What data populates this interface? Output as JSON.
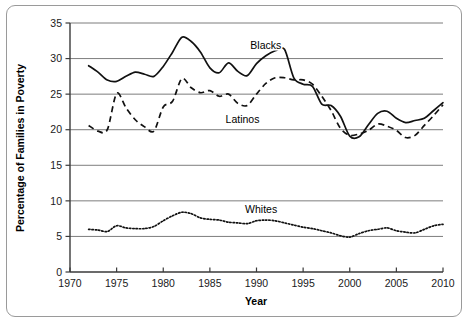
{
  "chart_data": {
    "type": "line",
    "title": "",
    "xlabel": "Year",
    "ylabel": "Percentage of Families in Poverty",
    "xlim": [
      1970,
      2010
    ],
    "ylim": [
      0,
      35
    ],
    "xticks": [
      "1970",
      "1975",
      "1980",
      "1985",
      "1990",
      "1995",
      "2000",
      "2005",
      "2010"
    ],
    "yticks": [
      "0",
      "5",
      "10",
      "15",
      "20",
      "25",
      "30",
      "35"
    ],
    "grid": "horizontal",
    "legend_position": "inline-labels",
    "series": [
      {
        "name": "Blacks",
        "style": "solid",
        "label_x": 1991.0,
        "label_y": 31.4,
        "x": [
          1972,
          1973,
          1974,
          1975,
          1976,
          1977,
          1978,
          1979,
          1980,
          1981,
          1982,
          1983,
          1984,
          1985,
          1986,
          1987,
          1988,
          1989,
          1990,
          1991,
          1992,
          1993,
          1994,
          1995,
          1996,
          1997,
          1998,
          1999,
          2000,
          2001,
          2002,
          2003,
          2004,
          2005,
          2006,
          2007,
          2008,
          2009,
          2010
        ],
        "values": [
          29.0,
          28.1,
          27.0,
          26.8,
          27.5,
          28.1,
          27.8,
          27.5,
          28.9,
          30.9,
          33.0,
          32.4,
          30.9,
          28.7,
          28.0,
          29.4,
          28.2,
          27.6,
          29.3,
          30.4,
          31.1,
          31.3,
          27.3,
          26.4,
          26.1,
          23.6,
          23.4,
          21.9,
          19.1,
          19.0,
          20.7,
          22.3,
          22.6,
          21.6,
          21.0,
          21.3,
          21.6,
          22.7,
          23.8
        ]
      },
      {
        "name": "Latinos",
        "style": "dashed",
        "label_x": 1988.5,
        "label_y": 21.0,
        "x": [
          1972,
          1973,
          1974,
          1975,
          1976,
          1977,
          1978,
          1979,
          1980,
          1981,
          1982,
          1983,
          1984,
          1985,
          1986,
          1987,
          1988,
          1989,
          1990,
          1991,
          1992,
          1993,
          1994,
          1995,
          1996,
          1997,
          1998,
          1999,
          2000,
          2001,
          2002,
          2003,
          2004,
          2005,
          2006,
          2007,
          2008,
          2009,
          2010
        ],
        "values": [
          20.6,
          19.8,
          20.0,
          25.1,
          23.1,
          21.4,
          20.4,
          19.8,
          23.2,
          24.0,
          27.2,
          25.9,
          25.2,
          25.5,
          24.7,
          25.0,
          23.7,
          23.4,
          25.0,
          26.5,
          27.3,
          27.3,
          27.0,
          27.0,
          26.4,
          24.7,
          22.7,
          20.2,
          19.2,
          19.4,
          19.9,
          20.8,
          20.5,
          19.9,
          18.9,
          19.2,
          20.6,
          22.0,
          23.5
        ]
      },
      {
        "name": "Whites",
        "style": "dotted",
        "label_x": 1990.5,
        "label_y": 8.3,
        "x": [
          1972,
          1973,
          1974,
          1975,
          1976,
          1977,
          1978,
          1979,
          1980,
          1981,
          1982,
          1983,
          1984,
          1985,
          1986,
          1987,
          1988,
          1989,
          1990,
          1991,
          1992,
          1993,
          1994,
          1995,
          1996,
          1997,
          1998,
          1999,
          2000,
          2001,
          2002,
          2003,
          2004,
          2005,
          2006,
          2007,
          2008,
          2009,
          2010
        ],
        "values": [
          6.0,
          5.9,
          5.7,
          6.5,
          6.2,
          6.1,
          6.1,
          6.4,
          7.2,
          7.9,
          8.4,
          8.2,
          7.6,
          7.4,
          7.3,
          7.0,
          6.9,
          6.8,
          7.2,
          7.3,
          7.2,
          6.9,
          6.6,
          6.3,
          6.1,
          5.8,
          5.5,
          5.1,
          4.9,
          5.4,
          5.8,
          6.0,
          6.2,
          5.8,
          5.6,
          5.5,
          6.0,
          6.5,
          6.7
        ]
      }
    ]
  }
}
